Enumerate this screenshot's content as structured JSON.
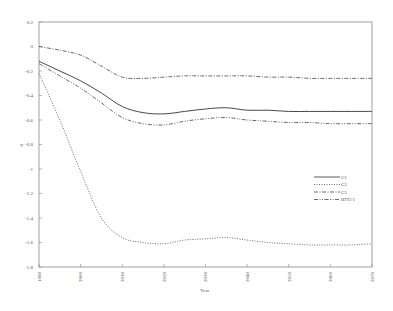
{
  "chart_data": {
    "type": "line",
    "title": "",
    "xlabel": "Year",
    "ylabel": "Y",
    "xlim": [
      1990,
      2070
    ],
    "ylim": [
      -1.8,
      0.2
    ],
    "grid": false,
    "legend_position": "right-middle inside",
    "x_ticks": [
      "1990",
      "2000",
      "2010",
      "2020",
      "2030",
      "2040",
      "2050",
      "2060",
      "2070"
    ],
    "y_ticks": [
      "0.2",
      "0",
      "-0.2",
      "-0.4",
      "-0.6",
      "-0.8",
      "-1",
      "-1.2",
      "-1.4",
      "-1.6",
      "-1.8"
    ],
    "x": [
      1990,
      1995,
      2000,
      2005,
      2010,
      2015,
      2020,
      2025,
      2030,
      2035,
      2040,
      2045,
      2050,
      2055,
      2060,
      2065,
      2070
    ],
    "series": [
      {
        "name": "C1",
        "style": "solid",
        "values": [
          -0.12,
          -0.2,
          -0.28,
          -0.38,
          -0.49,
          -0.54,
          -0.55,
          -0.53,
          -0.51,
          -0.5,
          -0.52,
          -0.52,
          -0.53,
          -0.53,
          -0.53,
          -0.53,
          -0.53
        ]
      },
      {
        "name": "C2",
        "style": "dotted",
        "values": [
          -0.22,
          -0.6,
          -1.02,
          -1.4,
          -1.56,
          -1.6,
          -1.61,
          -1.58,
          -1.57,
          -1.56,
          -1.58,
          -1.6,
          -1.61,
          -1.62,
          -1.62,
          -1.62,
          -1.61
        ]
      },
      {
        "name": "C3",
        "style": "dash-dot",
        "values": [
          0.0,
          -0.03,
          -0.07,
          -0.16,
          -0.25,
          -0.26,
          -0.25,
          -0.24,
          -0.24,
          -0.24,
          -0.24,
          -0.25,
          -0.25,
          -0.26,
          -0.26,
          -0.26,
          -0.26
        ]
      },
      {
        "name": "BTU/1",
        "style": "dash-dot-dot",
        "values": [
          -0.14,
          -0.24,
          -0.34,
          -0.46,
          -0.58,
          -0.63,
          -0.64,
          -0.61,
          -0.59,
          -0.58,
          -0.6,
          -0.61,
          -0.62,
          -0.62,
          -0.63,
          -0.63,
          -0.63
        ]
      }
    ]
  }
}
